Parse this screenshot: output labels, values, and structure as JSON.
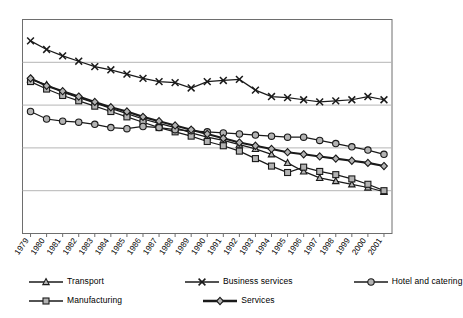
{
  "chart_data": {
    "type": "line",
    "title": "",
    "subtitle": "",
    "xlabel": "",
    "ylabel": "",
    "grid": true,
    "legend_position": "bottom",
    "ylim": [
      0,
      100
    ],
    "yticks_visible": false,
    "categories": [
      "1979",
      "1980",
      "1981",
      "1982",
      "1983",
      "1984",
      "1985",
      "1986",
      "1987",
      "1988",
      "1989",
      "1990",
      "1991",
      "1992",
      "1993",
      "1994",
      "1995",
      "1996",
      "1997",
      "1998",
      "1999",
      "2000",
      "2001"
    ],
    "series": [
      {
        "name": "Transport",
        "marker": "triangle",
        "values": [
          72,
          69.5,
          66,
          63.5,
          61,
          58.5,
          56,
          53.5,
          51.5,
          49.5,
          47,
          45,
          43.5,
          41.5,
          39.5,
          37,
          33,
          29,
          26,
          24.5,
          23,
          21.5,
          19.5
        ]
      },
      {
        "name": "Manufacturing",
        "marker": "square",
        "values": [
          71,
          67.5,
          64.5,
          62,
          59.5,
          57,
          54.5,
          52,
          49.5,
          47.5,
          45.5,
          43,
          41,
          38.5,
          35,
          31.5,
          28.5,
          31,
          29,
          27.5,
          25.5,
          23,
          20
        ]
      },
      {
        "name": "Business services",
        "marker": "cross",
        "values": [
          90,
          86,
          83,
          80.5,
          78,
          76.5,
          74.5,
          72.5,
          71,
          70.5,
          68,
          71,
          71.5,
          72,
          67,
          64,
          63.5,
          62.5,
          61.5,
          62,
          62.5,
          64,
          62.5
        ]
      },
      {
        "name": "Hotel and catering",
        "marker": "circle",
        "values": [
          57,
          53.5,
          52.5,
          52,
          51,
          49.5,
          49,
          50,
          49.5,
          48.5,
          48,
          47.5,
          47,
          46.5,
          46,
          45.5,
          45,
          45,
          43.5,
          42,
          40.5,
          39,
          37
        ]
      },
      {
        "name": "Services",
        "marker": "diamond",
        "values": [
          72.5,
          69,
          66.5,
          64,
          61.5,
          59,
          57,
          54.5,
          52.5,
          50.5,
          48.5,
          46.5,
          44.5,
          42.5,
          41,
          39.5,
          38,
          37,
          36,
          35,
          34,
          33,
          31.5
        ]
      }
    ],
    "legend": [
      {
        "name": "Transport",
        "marker": "triangle"
      },
      {
        "name": "Manufacturing",
        "marker": "square"
      },
      {
        "name": "Business services",
        "marker": "cross"
      },
      {
        "name": "Services",
        "marker": "diamond"
      },
      {
        "name": "Hotel and catering",
        "marker": "circle"
      }
    ],
    "colors": {
      "line": "#1a1a1a",
      "marker_fill": "#b3b3b3",
      "grid": "#b5b5b5",
      "frame": "#6e6e6e",
      "background": "#ffffff"
    }
  }
}
